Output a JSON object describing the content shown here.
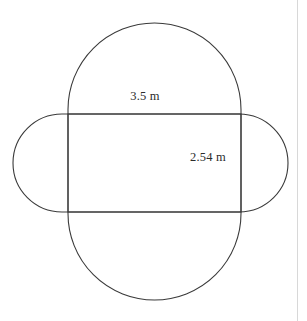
{
  "figure": {
    "type": "geometry-diagram",
    "background_color": "#ffffff",
    "stroke_color": "#3a3a3a",
    "stroke_width": 1,
    "divider_color": "#d8d8d8",
    "labels": {
      "top": "3.5 m",
      "side": "2.54 m"
    },
    "shapes": {
      "vertical_capsule": {
        "name": "vertical-stadium",
        "x": 68,
        "y": 23,
        "width": 173,
        "height": 277,
        "corner_radius": 86.5
      },
      "horizontal_capsule": {
        "name": "horizontal-stadium",
        "x": 13,
        "y": 114,
        "width": 275,
        "height": 98,
        "corner_radius": 49
      },
      "rectangle": {
        "name": "central-rectangle",
        "x": 68,
        "y": 114,
        "width": 173,
        "height": 98
      }
    }
  },
  "chart_data": {
    "type": "diagram",
    "title": "",
    "annotations": [
      {
        "text": "3.5 m",
        "x": 145,
        "y": 97,
        "refers_to": "rectangle-width"
      },
      {
        "text": "2.54 m",
        "x": 208,
        "y": 158,
        "refers_to": "rectangle-height"
      }
    ],
    "measurements": [
      {
        "label": "3.5 m",
        "value": 3.5,
        "unit": "m",
        "dimension": "width"
      },
      {
        "label": "2.54 m",
        "value": 2.54,
        "unit": "m",
        "dimension": "height"
      }
    ]
  }
}
